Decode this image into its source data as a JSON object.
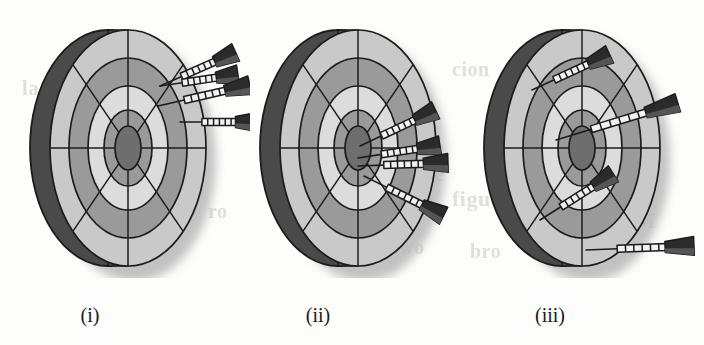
{
  "figure": {
    "header_text": "[Section 5.3]",
    "caption_labels": [
      "(i)",
      "(ii)",
      "(iii)"
    ],
    "colors": {
      "rim_dark": "#4a4a4a",
      "ring_light": "#c9c9c9",
      "ring_medium": "#9a9a9a",
      "ring_pale": "#dcdcdc",
      "bullseye": "#6e6e6e",
      "outline": "#1c1c1c",
      "dart_body": "#2b2b2b",
      "dart_barrel": "#f2f2f2",
      "background": "#fdfdfc",
      "shadow": "#b8b8b8"
    },
    "boards": [
      {
        "id": "board-i",
        "label": "(i)",
        "label_center_x": 90,
        "left": 10,
        "dart_count": 4,
        "grouping": "tight cluster off-center, upper right",
        "darts": [
          {
            "name": "dart-1",
            "tip_x": 150,
            "tip_y": 68,
            "tail_x": 222,
            "tail_y": 36
          },
          {
            "name": "dart-2",
            "tip_x": 150,
            "tip_y": 68,
            "tail_x": 224,
            "tail_y": 57
          },
          {
            "name": "dart-3",
            "tip_x": 148,
            "tip_y": 88,
            "tail_x": 236,
            "tail_y": 68
          },
          {
            "name": "dart-4",
            "tip_x": 170,
            "tip_y": 104,
            "tail_x": 243,
            "tail_y": 104
          }
        ]
      },
      {
        "id": "board-ii",
        "label": "(ii)",
        "label_center_x": 318,
        "left": 240,
        "dart_count": 4,
        "grouping": "tight cluster centred on bullseye",
        "darts": [
          {
            "name": "dart-1",
            "tip_x": 120,
            "tip_y": 128,
            "tail_x": 192,
            "tail_y": 94
          },
          {
            "name": "dart-2",
            "tip_x": 118,
            "tip_y": 140,
            "tail_x": 196,
            "tail_y": 128
          },
          {
            "name": "dart-3",
            "tip_x": 118,
            "tip_y": 148,
            "tail_x": 204,
            "tail_y": 145
          },
          {
            "name": "dart-4",
            "tip_x": 124,
            "tip_y": 158,
            "tail_x": 200,
            "tail_y": 196
          }
        ]
      },
      {
        "id": "board-iii",
        "label": "(iii)",
        "label_center_x": 550,
        "left": 464,
        "dart_count": 4,
        "grouping": "widely scattered across the board",
        "darts": [
          {
            "name": "dart-1",
            "tip_x": 68,
            "tip_y": 72,
            "tail_x": 142,
            "tail_y": 38
          },
          {
            "name": "dart-2",
            "tip_x": 92,
            "tip_y": 122,
            "tail_x": 210,
            "tail_y": 86
          },
          {
            "name": "dart-3",
            "tip_x": 76,
            "tip_y": 202,
            "tail_x": 146,
            "tail_y": 158
          },
          {
            "name": "dart-4",
            "tip_x": 122,
            "tip_y": 232,
            "tail_x": 226,
            "tail_y": 228
          }
        ]
      }
    ],
    "board_geometry": {
      "center_x": 118,
      "center_y": 130,
      "rim_offset_x": -20,
      "rings": [
        {
          "name": "rim",
          "rx": 78,
          "ry": 118,
          "fill": "#4a4a4a"
        },
        {
          "name": "outer-light",
          "rx": 78,
          "ry": 118,
          "fill": "#c9c9c9"
        },
        {
          "name": "ring-medium",
          "rx": 59,
          "ry": 90,
          "fill": "#9a9a9a"
        },
        {
          "name": "ring-pale",
          "rx": 40,
          "ry": 62,
          "fill": "#dcdcdc"
        },
        {
          "name": "ring-inner",
          "rx": 24,
          "ry": 38,
          "fill": "#9a9a9a"
        },
        {
          "name": "bullseye",
          "rx": 13,
          "ry": 22,
          "fill": "#6e6e6e"
        }
      ],
      "spokes": [
        "vertical",
        "horizontal",
        "diagonal-ne-sw",
        "diagonal-nw-se"
      ]
    },
    "bleed_through": [
      {
        "text": "la",
        "x": 300,
        "y": 52,
        "size": 22
      },
      {
        "text": "cion",
        "x": 452,
        "y": 58,
        "size": 20
      },
      {
        "text": "vi",
        "x": 492,
        "y": 92,
        "size": 21
      },
      {
        "text": "ro",
        "x": 398,
        "y": 120,
        "size": 20
      },
      {
        "text": "lo",
        "x": 576,
        "y": 118,
        "size": 20
      },
      {
        "text": "Se",
        "x": 420,
        "y": 160,
        "size": 24
      },
      {
        "text": "figu",
        "x": 452,
        "y": 186,
        "size": 22
      },
      {
        "text": "id",
        "x": 608,
        "y": 158,
        "size": 20
      },
      {
        "text": "w",
        "x": 596,
        "y": 196,
        "size": 20
      },
      {
        "text": "M",
        "x": 636,
        "y": 210,
        "size": 20
      },
      {
        "text": "two",
        "x": 392,
        "y": 236,
        "size": 20
      },
      {
        "text": "bro",
        "x": 470,
        "y": 240,
        "size": 20
      },
      {
        "text": "la",
        "x": 22,
        "y": 76,
        "size": 21
      },
      {
        "text": "ro",
        "x": 208,
        "y": 200,
        "size": 20
      }
    ]
  }
}
